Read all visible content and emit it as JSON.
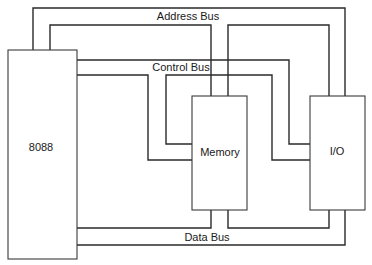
{
  "diagram": {
    "type": "system bus block diagram",
    "components": {
      "cpu": {
        "label": "8088"
      },
      "memory": {
        "label": "Memory"
      },
      "io": {
        "label": "I/O"
      }
    },
    "buses": {
      "address": {
        "label": "Address Bus"
      },
      "control": {
        "label": "Control Bus"
      },
      "data": {
        "label": "Data Bus"
      }
    },
    "colors": {
      "line": "#2a2a2a",
      "background": "#ffffff",
      "text": "#1a1a1a"
    }
  }
}
